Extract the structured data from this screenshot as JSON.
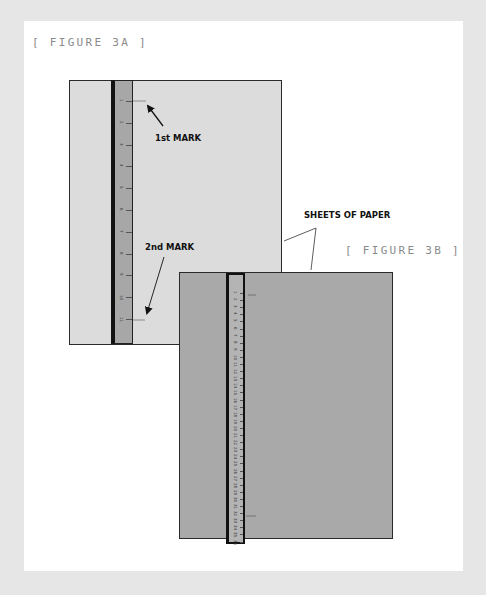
{
  "figure_a": {
    "label": "[ FIGURE 3A ]",
    "first_mark_label": "1st MARK",
    "second_mark_label": "2nd MARK",
    "ruler_numbers": [
      "1",
      "2",
      "3",
      "4",
      "5",
      "6",
      "7",
      "8",
      "9",
      "10",
      "11"
    ]
  },
  "figure_b": {
    "label": "[ FIGURE 3B ]",
    "ruler_numbers": [
      "1",
      "2",
      "3",
      "4",
      "5",
      "6",
      "7",
      "8",
      "9",
      "10",
      "11",
      "12",
      "13",
      "14",
      "15",
      "16",
      "17",
      "18",
      "19",
      "20",
      "21",
      "22",
      "23",
      "24",
      "25",
      "26",
      "27",
      "28",
      "29",
      "30",
      "31",
      "32",
      "33",
      "34",
      "35",
      "36"
    ]
  },
  "callout": {
    "sheets_label": "SHEETS OF PAPER"
  },
  "colors": {
    "background": "#e6e6e6",
    "panel": "#ffffff",
    "sheet_a": "#dcdcdc",
    "sheet_b": "#a9a9a9",
    "ruler": "#a7a7a7",
    "label_gray": "#8a8a8a"
  }
}
